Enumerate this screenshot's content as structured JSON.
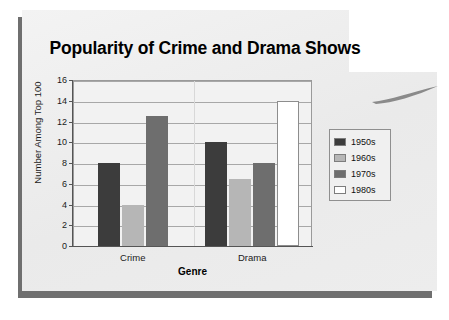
{
  "slide": {
    "background_color": "#ffffff",
    "sheet_color": "#eeeeee",
    "shadow_color": "#6f6f6f"
  },
  "chart_data": {
    "type": "bar",
    "title": "Popularity of Crime and Drama Shows",
    "xlabel": "Genre",
    "ylabel": "Number Among Top 100",
    "categories": [
      "Crime",
      "Drama"
    ],
    "ylim": [
      0,
      16
    ],
    "yticks": [
      0,
      2,
      4,
      6,
      8,
      10,
      12,
      14,
      16
    ],
    "grid": true,
    "legend_position": "right",
    "series": [
      {
        "name": "1950s",
        "color": "#3c3c3c",
        "values": [
          8,
          10
        ]
      },
      {
        "name": "1960s",
        "color": "#b6b6b6",
        "values": [
          4,
          6.5
        ]
      },
      {
        "name": "1970s",
        "color": "#6e6e6e",
        "values": [
          12.5,
          8
        ]
      },
      {
        "name": "1980s",
        "color": "#ffffff",
        "values": [
          null,
          14
        ]
      }
    ]
  }
}
